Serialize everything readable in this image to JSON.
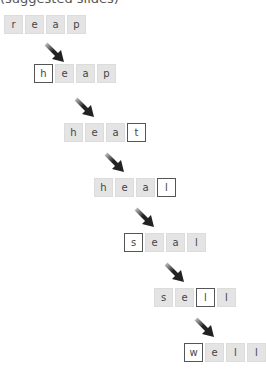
{
  "caption": "(suggested slides)",
  "steps": [
    {
      "word": "reap",
      "letters": [
        "r",
        "e",
        "a",
        "p"
      ],
      "changed_index": null,
      "left": 4,
      "top": 15
    },
    {
      "word": "heap",
      "letters": [
        "h",
        "e",
        "a",
        "p"
      ],
      "changed_index": 0,
      "left": 34,
      "top": 64
    },
    {
      "word": "heat",
      "letters": [
        "h",
        "e",
        "a",
        "t"
      ],
      "changed_index": 3,
      "left": 64,
      "top": 123
    },
    {
      "word": "heal",
      "letters": [
        "h",
        "e",
        "a",
        "l"
      ],
      "changed_index": 3,
      "left": 94,
      "top": 178
    },
    {
      "word": "seal",
      "letters": [
        "s",
        "e",
        "a",
        "l"
      ],
      "changed_index": 0,
      "left": 124,
      "top": 233
    },
    {
      "word": "sell",
      "letters": [
        "s",
        "e",
        "l",
        "l"
      ],
      "changed_index": 2,
      "left": 154,
      "top": 288
    },
    {
      "word": "well",
      "letters": [
        "w",
        "e",
        "l",
        "l"
      ],
      "changed_index": 0,
      "left": 184,
      "top": 343
    }
  ],
  "arrows": [
    {
      "left": 44,
      "top": 42
    },
    {
      "left": 74,
      "top": 97
    },
    {
      "left": 104,
      "top": 152
    },
    {
      "left": 134,
      "top": 207
    },
    {
      "left": 164,
      "top": 262
    },
    {
      "left": 194,
      "top": 317
    }
  ]
}
